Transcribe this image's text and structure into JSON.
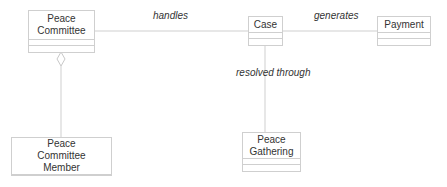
{
  "diagram": {
    "type": "uml-class-diagram",
    "classes": [
      {
        "id": "peace_committee",
        "name": "Peace Committee"
      },
      {
        "id": "case",
        "name": "Case"
      },
      {
        "id": "payment",
        "name": "Payment"
      },
      {
        "id": "peace_committee_member",
        "name": "Peace Committee Member"
      },
      {
        "id": "peace_gathering",
        "name": "Peace Gathering"
      }
    ],
    "associations": [
      {
        "from": "peace_committee",
        "to": "case",
        "label": "handles",
        "kind": "association"
      },
      {
        "from": "case",
        "to": "payment",
        "label": "generates",
        "kind": "association"
      },
      {
        "from": "case",
        "to": "peace_gathering",
        "label": "resolved through",
        "kind": "association"
      },
      {
        "from": "peace_committee",
        "to": "peace_committee_member",
        "label": "",
        "kind": "aggregation"
      }
    ]
  },
  "labels": {
    "handles": "handles",
    "generates": "generates",
    "resolved_through": "resolved through"
  },
  "colors": {
    "line": "#cfcfcf",
    "text": "#333333",
    "background": "#ffffff"
  }
}
